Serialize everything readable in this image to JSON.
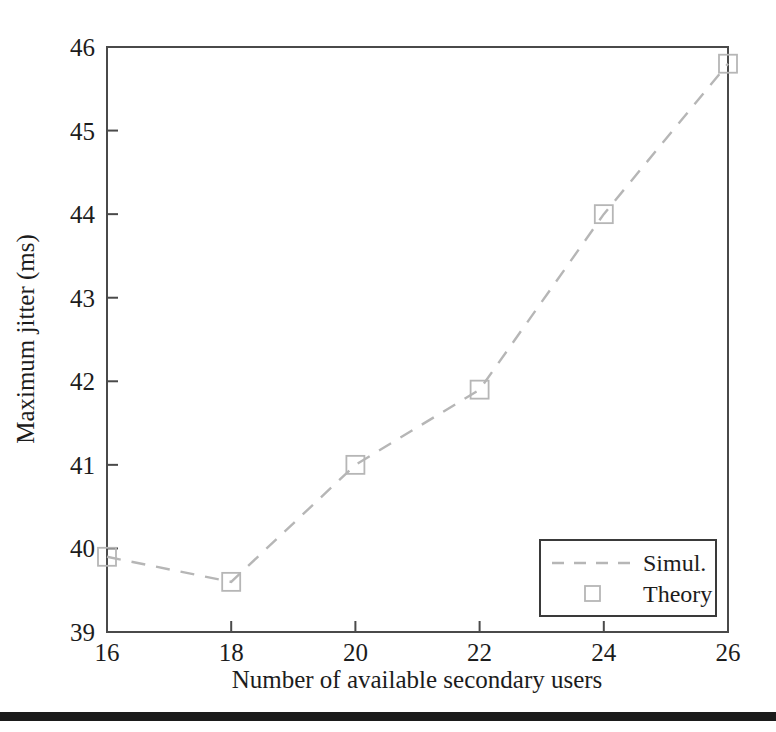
{
  "figure": {
    "background_color": "#ffffff",
    "frame_color": "#4a4a4a",
    "series_color": "#b6b6b6",
    "text_color": "#1c1c1c",
    "rule_color": "#1b1b1b"
  },
  "chart_data": {
    "type": "line",
    "title": "",
    "xlabel": "Number of available secondary users",
    "ylabel": "Maximum jitter (ms)",
    "xlim": [
      16,
      26
    ],
    "ylim": [
      39,
      46
    ],
    "xticks": [
      16,
      18,
      20,
      22,
      24,
      26
    ],
    "xtick_labels": [
      "16",
      "18",
      "20",
      "22",
      "24",
      "26"
    ],
    "yticks": [
      39,
      40,
      41,
      42,
      43,
      44,
      45,
      46
    ],
    "ytick_labels": [
      "39",
      "40",
      "41",
      "42",
      "43",
      "44",
      "45",
      "46"
    ],
    "grid": false,
    "legend_position": "lower right",
    "x": [
      16,
      18,
      20,
      22,
      24,
      26
    ],
    "series": [
      {
        "name": "Simul.",
        "style": "dashed-line",
        "marker": "none",
        "color": "#b6b6b6",
        "values": [
          39.9,
          39.6,
          41.0,
          41.9,
          44.0,
          45.8
        ]
      },
      {
        "name": "Theory",
        "style": "markers",
        "marker": "open-square",
        "color": "#b6b6b6",
        "values": [
          39.9,
          39.6,
          41.0,
          41.9,
          44.0,
          45.8
        ]
      }
    ],
    "legend": [
      {
        "label": "Simul.",
        "marker": "dashed-line"
      },
      {
        "label": "Theory",
        "marker": "open-square"
      }
    ]
  }
}
